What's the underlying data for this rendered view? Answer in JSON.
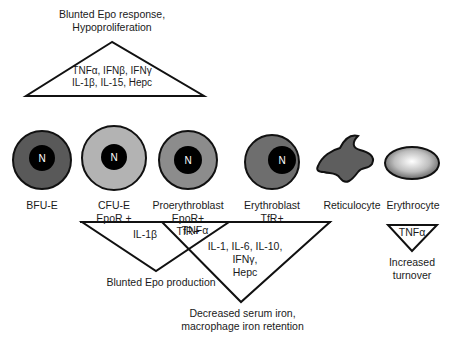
{
  "top_effect": {
    "line1": "Blunted Epo response,",
    "line2": "Hypoproliferation"
  },
  "top_triangle": {
    "line1": "TNFα, IFNβ, IFNγ",
    "line2": "IL-1β, IL-15, Hepc"
  },
  "cells": [
    {
      "name": "BFU-E",
      "nucleus": "N",
      "markers": [],
      "color": "#595959"
    },
    {
      "name": "CFU-E",
      "nucleus": "N",
      "markers": [
        "EpoR +"
      ],
      "color": "#b3b3b3"
    },
    {
      "name": "Proerythroblast",
      "nucleus": "N",
      "markers": [
        "EpoR+",
        "TfR+"
      ],
      "color": "#8c8c8c"
    },
    {
      "name": "Erythroblast",
      "nucleus": "N",
      "markers": [
        "TfR+"
      ],
      "color": "#6e6e6e"
    },
    {
      "name": "Reticulocyte",
      "nucleus": "",
      "markers": [],
      "color": "#5e5e5e"
    },
    {
      "name": "Erythrocyte",
      "nucleus": "",
      "markers": [],
      "color": "#c8c8c8"
    }
  ],
  "bottom_triangles": {
    "il1b": {
      "label": "IL-1β",
      "effect": "Blunted Epo production"
    },
    "tnfa_overlap": {
      "label": "TNFα"
    },
    "iron": {
      "lines": [
        "IL-1, IL-6, IL-10,",
        "IFNγ,",
        "Hepc"
      ],
      "effect_line1": "Decreased serum iron,",
      "effect_line2": "macrophage iron retention"
    },
    "turnover": {
      "label": "TNFα",
      "effect_line1": "Increased",
      "effect_line2": "turnover"
    }
  }
}
